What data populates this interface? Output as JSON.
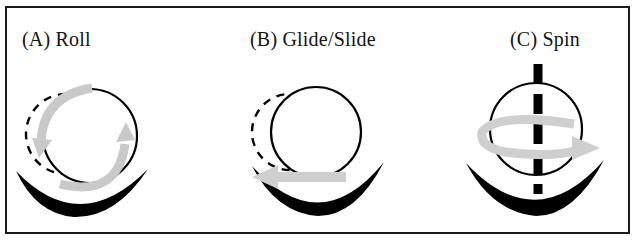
{
  "figure": {
    "title_visible": false,
    "background_color": "#ffffff",
    "border_color": "#1a1a1a",
    "ink_color": "#000000",
    "arrow_color": "#c8c8c8",
    "arrow_color_light": "#d4d4d4",
    "width": 637,
    "height": 242
  },
  "panels": [
    {
      "id": "a",
      "label": "(A) Roll",
      "motion": "roll",
      "elements": {
        "ball_solid": "solid-circle",
        "ball_ghost": "dashed-circle",
        "surface": "concave-bowl",
        "arrow": "curved-rotation-arrow",
        "axis": null
      }
    },
    {
      "id": "b",
      "label": "(B) Glide/Slide",
      "motion": "glide-slide",
      "elements": {
        "ball_solid": "solid-circle",
        "ball_ghost": "dashed-circle",
        "surface": "concave-bowl",
        "arrow": "straight-left-arrow",
        "axis": null
      }
    },
    {
      "id": "c",
      "label": "(C) Spin",
      "motion": "spin",
      "elements": {
        "ball_solid": "solid-circle",
        "ball_ghost": null,
        "surface": "concave-bowl",
        "arrow": "elliptical-spin-arrow",
        "axis": "vertical-dashed-axis"
      }
    }
  ]
}
